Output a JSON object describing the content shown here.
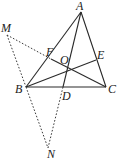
{
  "diagram": {
    "type": "geometry",
    "colors": {
      "line": "#2a2a2a",
      "dashed": "#3a3a3a",
      "label": "#222222",
      "background": "#ffffff"
    },
    "points": {
      "A": {
        "label": "A",
        "x": 81,
        "y": 12,
        "lx": 76,
        "ly": 10
      },
      "B": {
        "label": "B",
        "x": 26,
        "y": 87,
        "lx": 15,
        "ly": 93
      },
      "C": {
        "label": "C",
        "x": 106,
        "y": 87,
        "lx": 108,
        "ly": 93
      },
      "D": {
        "label": "D",
        "x": 63,
        "y": 87,
        "lx": 62,
        "ly": 100
      },
      "E": {
        "label": "E",
        "x": 96,
        "y": 60,
        "lx": 97,
        "ly": 59
      },
      "F": {
        "label": "F",
        "x": 51,
        "y": 59,
        "lx": 46,
        "ly": 56
      },
      "O": {
        "label": "O",
        "x": 68,
        "y": 68,
        "lx": 60,
        "ly": 64
      },
      "M": {
        "label": "M",
        "x": 7,
        "y": 35,
        "lx": 1,
        "ly": 32
      },
      "N": {
        "label": "N",
        "x": 48,
        "y": 148,
        "lx": 47,
        "ly": 158
      }
    },
    "solid_segments": [
      [
        "A",
        "B"
      ],
      [
        "A",
        "C"
      ],
      [
        "B",
        "C"
      ],
      [
        "A",
        "D"
      ],
      [
        "B",
        "E"
      ],
      [
        "C",
        "F"
      ]
    ],
    "dashed_segments": [
      [
        "M",
        "F"
      ],
      [
        "M",
        "B"
      ],
      [
        "B",
        "N"
      ],
      [
        "N",
        "D"
      ]
    ]
  }
}
